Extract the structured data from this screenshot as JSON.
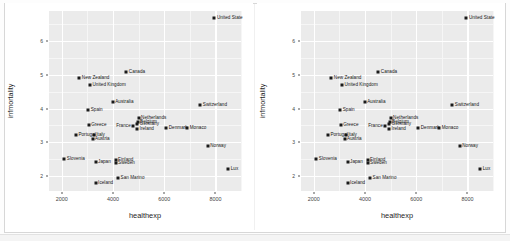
{
  "figure": {
    "background": "#ffffff",
    "panel_background": "#ebebeb",
    "grid_color": "#ffffff",
    "point_color": "#1a1a1a",
    "panel_count": 2
  },
  "chart_data": {
    "type": "scatter",
    "title": "",
    "xlabel": "healthexp",
    "ylabel": "infmortality",
    "xlim": [
      1500,
      9000
    ],
    "ylim": [
      1.55,
      6.9
    ],
    "xticks": [
      2000,
      4000,
      6000,
      8000
    ],
    "xtick_labels": [
      "2000",
      "4000",
      "6000",
      "8000"
    ],
    "yticks": [
      2,
      3,
      4,
      5,
      6
    ],
    "ytick_labels": [
      "2",
      "3",
      "4",
      "5",
      "6"
    ],
    "grid": true,
    "legend": "none",
    "panels": 2,
    "points": [
      {
        "label": "United States",
        "label_shown": "United State",
        "healthexp": 7960,
        "infmortality": 6.7,
        "label_pos": "right"
      },
      {
        "label": "Canada",
        "label_shown": "Canada",
        "healthexp": 4520,
        "infmortality": 5.1,
        "label_pos": "right"
      },
      {
        "label": "New Zealand",
        "label_shown": "New Zealand",
        "healthexp": 2683,
        "infmortality": 4.9,
        "label_pos": "right"
      },
      {
        "label": "United Kingdom",
        "label_shown": "United Kingdom",
        "healthexp": 3100,
        "infmortality": 4.7,
        "label_pos": "right"
      },
      {
        "label": "Australia",
        "label_shown": "Australia",
        "healthexp": 3990,
        "infmortality": 4.2,
        "label_pos": "right"
      },
      {
        "label": "Switzerland",
        "label_shown": "Switzerland",
        "healthexp": 7410,
        "infmortality": 4.1,
        "label_pos": "right"
      },
      {
        "label": "Spain",
        "label_shown": "Spain",
        "healthexp": 3032,
        "infmortality": 3.95,
        "label_pos": "right"
      },
      {
        "label": "Netherlands",
        "label_shown": "Netherlands",
        "healthexp": 5000,
        "infmortality": 3.73,
        "label_pos": "right"
      },
      {
        "label": "Belgium",
        "label_shown": "Belgium",
        "healthexp": 4960,
        "infmortality": 3.59,
        "label_pos": "right"
      },
      {
        "label": "Germany",
        "label_shown": "Germany",
        "healthexp": 4950,
        "infmortality": 3.54,
        "label_pos": "right"
      },
      {
        "label": "Greece",
        "label_shown": "Greece",
        "healthexp": 3050,
        "infmortality": 3.5,
        "label_pos": "right"
      },
      {
        "label": "Denmark",
        "label_shown": "Denmark",
        "healthexp": 6080,
        "infmortality": 3.42,
        "label_pos": "right"
      },
      {
        "label": "Monaco",
        "label_shown": "Monaco",
        "healthexp": 6900,
        "infmortality": 3.42,
        "label_pos": "right"
      },
      {
        "label": "France",
        "label_shown": "France",
        "healthexp": 4790,
        "infmortality": 3.48,
        "label_pos": "left"
      },
      {
        "label": "Ireland",
        "label_shown": "Ireland",
        "healthexp": 4940,
        "infmortality": 3.4,
        "label_pos": "right"
      },
      {
        "label": "Italy",
        "label_shown": "Italy",
        "healthexp": 3250,
        "infmortality": 3.21,
        "label_pos": "right"
      },
      {
        "label": "Portugal",
        "label_shown": "Portugal",
        "healthexp": 2550,
        "infmortality": 3.2,
        "label_pos": "right"
      },
      {
        "label": "Austria",
        "label_shown": "Austria",
        "healthexp": 3200,
        "infmortality": 3.1,
        "label_pos": "right"
      },
      {
        "label": "Norway",
        "label_shown": "Norway",
        "healthexp": 7700,
        "infmortality": 2.88,
        "label_pos": "right"
      },
      {
        "label": "Slovenia",
        "label_shown": "Slovenia",
        "healthexp": 2100,
        "infmortality": 2.49,
        "label_pos": "right"
      },
      {
        "label": "Finland",
        "label_shown": "Finland",
        "healthexp": 4100,
        "infmortality": 2.48,
        "label_pos": "right"
      },
      {
        "label": "Japan",
        "label_shown": "Japan",
        "healthexp": 3320,
        "infmortality": 2.42,
        "label_pos": "right"
      },
      {
        "label": "Sweden",
        "label_shown": "Sweden",
        "healthexp": 4100,
        "infmortality": 2.37,
        "label_pos": "right"
      },
      {
        "label": "Luxembourg",
        "label_shown": "Lux",
        "healthexp": 8500,
        "infmortality": 2.2,
        "label_pos": "right"
      },
      {
        "label": "San Marino",
        "label_shown": "San Marino",
        "healthexp": 4200,
        "infmortality": 1.94,
        "label_pos": "right"
      },
      {
        "label": "Iceland",
        "label_shown": "Iceland",
        "healthexp": 3320,
        "infmortality": 1.78,
        "label_pos": "right"
      }
    ]
  }
}
